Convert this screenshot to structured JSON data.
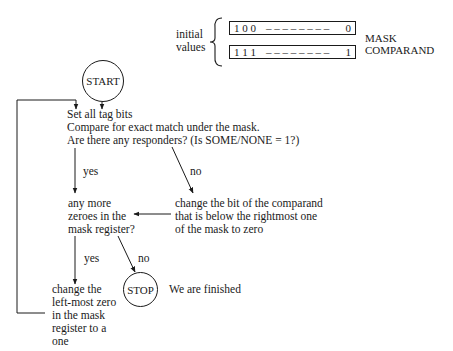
{
  "initial_values": {
    "label_line1": "initial",
    "label_line2": "values",
    "mask_register": {
      "left": "1 0 0",
      "dashes": "– – – – – – – –",
      "right": "0",
      "label": "MASK"
    },
    "comparand_register": {
      "left": "1 1 1",
      "dashes": "– – – – – – – –",
      "right": "1",
      "label": "COMPARAND"
    }
  },
  "nodes": {
    "start": "START",
    "stop": "STOP",
    "stop_note": "We are finished",
    "step1": {
      "line1": "Set all tag bits",
      "line2": "Compare for exact match under the mask.",
      "line3": "Are there any responders?  (Is SOME/NONE = 1?)"
    },
    "decision2": {
      "line1": "any more",
      "line2": "zeroes in the",
      "line3": "mask register?"
    },
    "change_comparand": {
      "line1": "change the bit of the comparand",
      "line2": "that is below the rightmost one",
      "line3": "of the mask to zero"
    },
    "change_mask": {
      "line1": "change the",
      "line2": "left-most zero",
      "line3": "in the mask",
      "line4": "register to a",
      "line5": "one"
    }
  },
  "edge_labels": {
    "responders_yes": "yes",
    "responders_no": "no",
    "zeroes_yes": "yes",
    "zeroes_no": "no"
  }
}
